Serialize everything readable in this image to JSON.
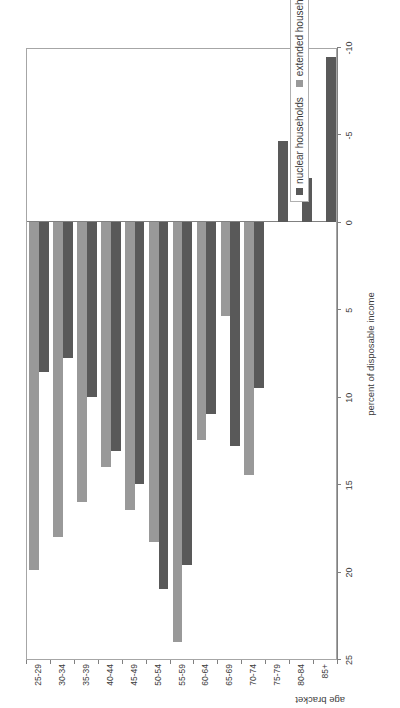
{
  "chart_data": {
    "type": "bar",
    "title": "",
    "orientation": "horizontal-rotated",
    "xlabel": "age bracket",
    "ylabel": "percent of disposable income",
    "categories": [
      "25-29",
      "30-34",
      "35-39",
      "40-44",
      "45-49",
      "50-54",
      "55-59",
      "60-64",
      "65-69",
      "70-74",
      "75-79",
      "80-84",
      "85+"
    ],
    "ylim": [
      -10,
      25
    ],
    "yticks": [
      25,
      20,
      15,
      10,
      5,
      0,
      -5,
      -10
    ],
    "ytick_labels": [
      "25",
      "20",
      "15",
      "10",
      "5",
      "0",
      "-5",
      "-10"
    ],
    "grid": false,
    "legend_position": "inside-bottom-left",
    "series": [
      {
        "name": "nuclear households",
        "color": "#595959",
        "values": [
          8.6,
          7.8,
          10.0,
          13.1,
          15.0,
          21.0,
          19.6,
          11.0,
          12.8,
          9.5,
          -4.6,
          -2.5,
          -9.4
        ]
      },
      {
        "name": "extended households",
        "color": "#999999",
        "values": [
          19.9,
          18.0,
          16.0,
          14.0,
          16.5,
          18.3,
          24.0,
          12.5,
          5.4,
          14.5,
          0.0,
          0.0,
          0.0
        ]
      }
    ]
  },
  "axes": {
    "value_axis_title": "percent of disposable income",
    "category_axis_title": "age bracket"
  },
  "legend": {
    "items": [
      {
        "label": "nuclear households",
        "color": "#595959"
      },
      {
        "label": "extended households",
        "color": "#999999"
      }
    ]
  }
}
